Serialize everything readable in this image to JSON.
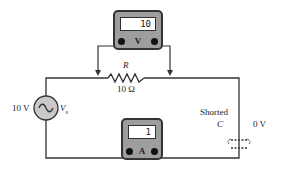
{
  "voltmeter": {
    "reading": "10",
    "unit_label": "V"
  },
  "ammeter": {
    "reading": "1",
    "unit_label": "A"
  },
  "resistor": {
    "symbol": "R",
    "value": "10 Ω"
  },
  "source": {
    "voltage": "10 V",
    "symbol": "Vs",
    "symbol_main": "V",
    "symbol_sub": "s"
  },
  "capacitor": {
    "status": "Shorted",
    "symbol": "C",
    "voltage": "0 V"
  },
  "colors": {
    "wire": "#333333",
    "meter_body": "#9e9e9e",
    "source_fill": "#c8c8c8"
  }
}
